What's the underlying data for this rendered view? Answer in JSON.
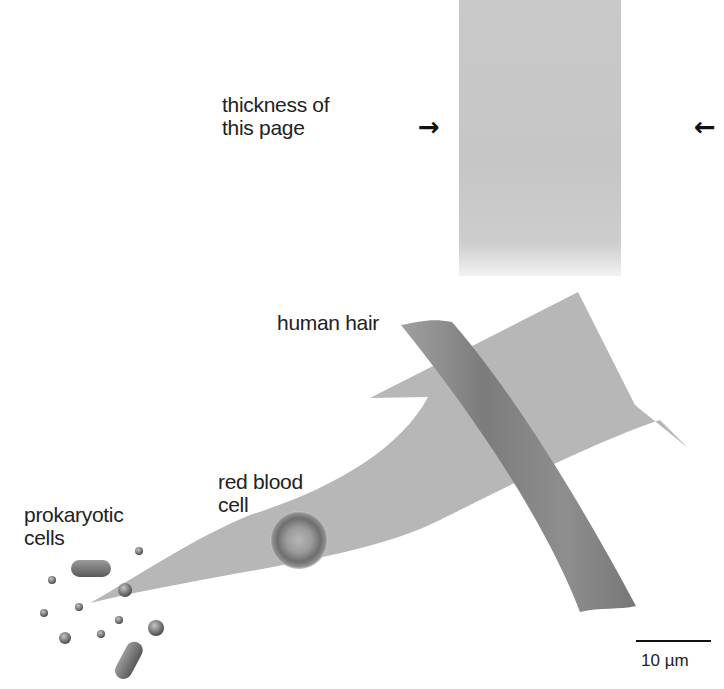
{
  "figure": {
    "labels": {
      "page_thickness": "thickness of\nthis page",
      "human_hair": "human hair",
      "red_blood_cell": "red blood\ncell",
      "prokaryotic_cells": "prokaryotic\ncells"
    },
    "scale_bar": {
      "value": "10 µm"
    },
    "markers": {
      "left_arrow": "→",
      "right_arrow": "←"
    },
    "colors": {
      "page_fill": "#c8c8c8",
      "expansion_arrow": "#b5b5b5",
      "hair": "#8a8a8a",
      "cell_shading": "#7a7a7a",
      "text": "#222222"
    }
  }
}
